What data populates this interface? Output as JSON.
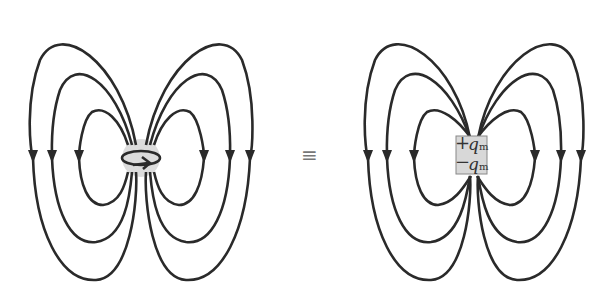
{
  "left_figure": {
    "title": "current loop magnetic dipole field",
    "source": "current-loop",
    "field_lines_per_side": 3
  },
  "equivalence_symbol": "≡",
  "right_figure": {
    "title": "magnetic charge dipole field",
    "charges": [
      {
        "sign": "+",
        "symbol": "q",
        "subscript": "m"
      },
      {
        "sign": "−",
        "symbol": "q",
        "subscript": "m"
      }
    ],
    "field_lines_per_side": 3
  },
  "colors": {
    "line": "#2a2a2a",
    "source_fill": "#d8d8d8",
    "equiv": "#777777"
  }
}
